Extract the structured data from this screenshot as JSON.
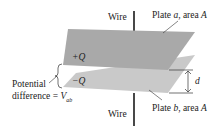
{
  "diagram": {
    "labels": {
      "wire_top": "Wire",
      "wire_bottom": "Wire",
      "plate_a_prefix": "Plate ",
      "plate_a_var": "a",
      "plate_a_suffix": ", area ",
      "plate_a_area": "A",
      "plate_b_prefix": "Plate ",
      "plate_b_var": "b",
      "plate_b_suffix": ", area ",
      "plate_b_area": "A",
      "charge_top": "+Q",
      "charge_bottom": "−Q",
      "separation": "d",
      "potential_line1": "Potential",
      "potential_line2": "difference = ",
      "potential_var": "V",
      "potential_sub": "ab"
    },
    "colors": {
      "plate_a": "#a9a9a9",
      "plate_b": "#c9c9c9",
      "wire": "#1a1a1a",
      "text": "#222222",
      "background": "#ffffff"
    }
  }
}
